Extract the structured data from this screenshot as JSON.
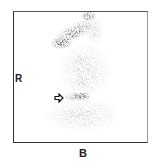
{
  "image": {
    "type": "scintigraphy-scan",
    "labels": {
      "side": "R",
      "bottom": "B"
    },
    "annotations": [
      {
        "kind": "arrow",
        "icon": "open-arrow-right-icon",
        "points_to": "focal-uptake"
      }
    ],
    "colors": {
      "background": "#ffffff",
      "uptake": "#1a1a1a",
      "frame": "#333333"
    }
  }
}
